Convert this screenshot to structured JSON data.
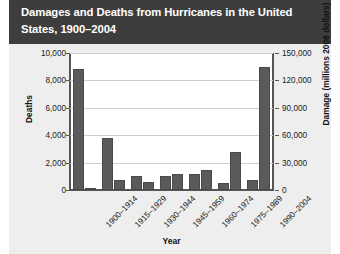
{
  "title": "Damages and Deaths from Hurricanes in the United States, 1900–2004",
  "colors": {
    "title_bar": "#3d3d3d",
    "panel": "#eeeeee",
    "plot_background": "#ffffff",
    "bar": "#5a5a5a",
    "axis": "#555555",
    "gridline": "#cfcfcf"
  },
  "chart_data": {
    "type": "bar",
    "title": "Damages and Deaths from Hurricanes in the United States, 1900–2004",
    "xlabel": "Year",
    "ylabel": "Deaths",
    "y2label": "Damage (millions 2006 dollars)",
    "categories": [
      "1900–1914",
      "1915–1929",
      "1930–1944",
      "1945–1959",
      "1960–1974",
      "1975–1989",
      "1990–2004"
    ],
    "series": [
      {
        "name": "Deaths",
        "axis": "left",
        "values": [
          8800,
          3800,
          1000,
          1000,
          1200,
          500,
          700
        ]
      },
      {
        "name": "Damage (millions 2006 dollars)",
        "axis": "right",
        "values": [
          1500,
          11000,
          9000,
          18000,
          22000,
          42000,
          135000
        ]
      }
    ],
    "ylim": [
      0,
      10000
    ],
    "y2lim": [
      0,
      150000
    ],
    "yticks": [
      0,
      2000,
      4000,
      6000,
      8000,
      10000
    ],
    "yticklabels": [
      "0",
      "2,000",
      "4,000",
      "6,000",
      "8,000",
      "10,000"
    ],
    "y2ticks": [
      0,
      30000,
      60000,
      90000,
      120000,
      150000
    ],
    "y2ticklabels": [
      "0",
      "30,000",
      "60,000",
      "90,000",
      "120,000",
      "150,000"
    ],
    "grid": true,
    "legend": "none",
    "xtick_rotation": -45
  }
}
